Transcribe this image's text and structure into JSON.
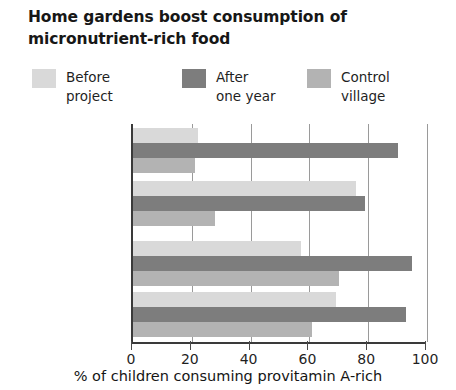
{
  "title": "Home gardens boost consumption of\nmicronutrient-rich food",
  "legend": {
    "items": [
      {
        "label": "Before\nproject",
        "color": "#d9d9d9"
      },
      {
        "label": "After\none year",
        "color": "#7d7d7d"
      },
      {
        "label": "Control\nvillage",
        "color": "#b3b3b3"
      }
    ]
  },
  "axis": {
    "x_title": "% of children consuming provitamin A-rich",
    "ticks": [
      "0",
      "20",
      "40",
      "60",
      "80",
      "100"
    ]
  },
  "chart_data": {
    "type": "bar",
    "orientation": "horizontal",
    "title": "Home gardens boost consumption of micronutrient-rich food",
    "xlabel": "% of children consuming provitamin A-rich",
    "ylabel": "",
    "xlim": [
      0,
      100
    ],
    "xticks": [
      0,
      20,
      40,
      60,
      80,
      100
    ],
    "grid": true,
    "legend_position": "top",
    "categories": [
      "Carrots",
      "Pumpkin/\nbutternut\nsquash",
      "Spinach",
      "Imifino\n(green, leafy\nvegetables)"
    ],
    "series": [
      {
        "name": "Before project",
        "color": "#d9d9d9",
        "values": [
          22,
          76,
          57,
          69
        ]
      },
      {
        "name": "After one year",
        "color": "#7d7d7d",
        "values": [
          90,
          79,
          95,
          93
        ]
      },
      {
        "name": "Control village",
        "color": "#b3b3b3",
        "values": [
          21,
          28,
          70,
          61
        ]
      }
    ]
  }
}
